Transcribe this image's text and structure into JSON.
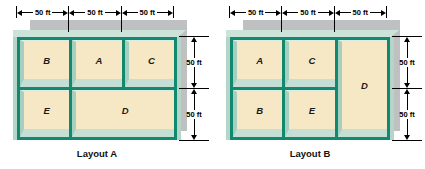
{
  "figures": [
    {
      "caption": "Layout A",
      "top_dims": [
        "50 ft",
        "50 ft",
        "50 ft"
      ],
      "side_dims": [
        "50 ft",
        "50 ft"
      ],
      "rooms": [
        "B",
        "A",
        "C",
        "E",
        "D"
      ]
    },
    {
      "caption": "Layout B",
      "top_dims": [
        "50 ft",
        "50 ft",
        "50 ft"
      ],
      "side_dims": [
        "50 ft",
        "50 ft"
      ],
      "rooms": [
        "A",
        "C",
        "D",
        "B",
        "E"
      ]
    }
  ],
  "colors": {
    "wall_teal": "#12896E",
    "floor_cream": "#f6e8c4",
    "bevel_light": "#c5dfd4",
    "bevel_dark": "#a6cec1",
    "top_band": "#cbe3d8",
    "shadow_gray": "#bfc0c2"
  }
}
